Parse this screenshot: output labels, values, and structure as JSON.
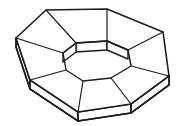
{
  "figure": {
    "title": "Octagonal ring solid",
    "style": {
      "background_color": "#ffffff",
      "line_color": "#1c1c1c",
      "fill_color": "#ffffff",
      "stroke_width_outer": 1.6,
      "stroke_width_inner": 1.4,
      "stroke_width_spoke": 1.2
    },
    "geometry": {
      "type": "annular-octagonal-prism",
      "outer_sides": 8,
      "inner_sides": 8,
      "top_facets": 8,
      "thickness_px": 9,
      "canvas": {
        "width": 191,
        "height": 126
      },
      "outer_top_octagon": [
        {
          "name": "outer-top-left",
          "x": 46,
          "y": 10
        },
        {
          "name": "outer-top-right",
          "x": 107,
          "y": 9
        },
        {
          "name": "outer-right-upper",
          "x": 163,
          "y": 32
        },
        {
          "name": "outer-right-lower",
          "x": 169,
          "y": 76
        },
        {
          "name": "outer-bottom-right",
          "x": 131,
          "y": 104
        },
        {
          "name": "outer-bottom-left",
          "x": 78,
          "y": 112
        },
        {
          "name": "outer-left-lower",
          "x": 30,
          "y": 80
        },
        {
          "name": "outer-left-upper",
          "x": 16,
          "y": 38
        }
      ],
      "inner_top_octagon": [
        {
          "name": "inner-top-left",
          "x": 76,
          "y": 43
        },
        {
          "name": "inner-top-right",
          "x": 107,
          "y": 41
        },
        {
          "name": "inner-right-upper",
          "x": 128,
          "y": 50
        },
        {
          "name": "inner-right-lower",
          "x": 131,
          "y": 66
        },
        {
          "name": "inner-bottom-right",
          "x": 111,
          "y": 78
        },
        {
          "name": "inner-bottom-left",
          "x": 83,
          "y": 81
        },
        {
          "name": "inner-left-lower",
          "x": 66,
          "y": 70
        },
        {
          "name": "inner-left-upper",
          "x": 63,
          "y": 53
        }
      ],
      "visible_side_faces": [
        "left-lower-side",
        "bottom-left-side",
        "bottom-side",
        "bottom-right-side",
        "right-lower-side"
      ],
      "visible_inner_wall_faces": [
        "inner-top-wall",
        "inner-upper-right-wall"
      ],
      "spokes": [
        "outer-top-left to inner-top-left",
        "outer-top-right to inner-top-right",
        "outer-right-upper to inner-right-upper",
        "outer-right-lower to inner-right-lower",
        "outer-bottom-right to inner-bottom-right",
        "outer-bottom-left to inner-bottom-left",
        "outer-left-lower to inner-left-lower",
        "outer-left-upper to inner-left-upper"
      ]
    },
    "labels": {
      "caption": "",
      "annotations": []
    }
  }
}
